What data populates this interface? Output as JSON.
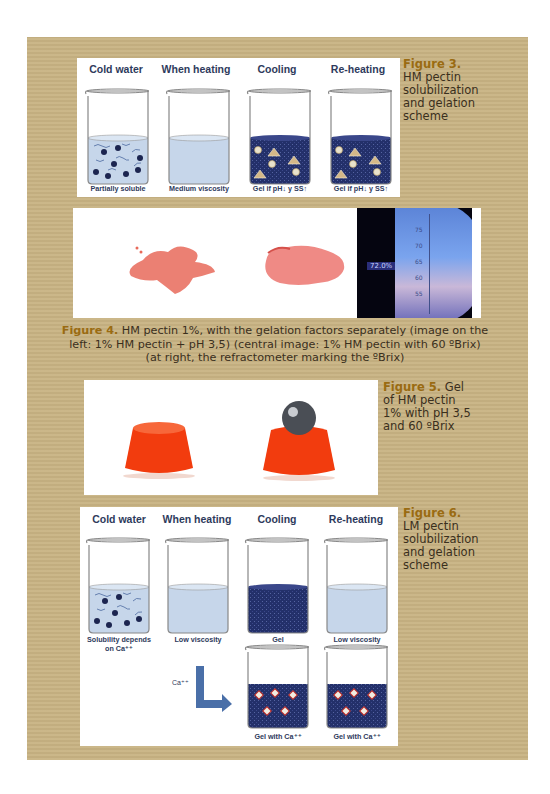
{
  "figure3": {
    "number": "Figure 3.",
    "caption": [
      "HM pectin",
      "solubilization",
      "and gelation",
      "scheme"
    ],
    "columns": [
      "Cold water",
      "When heating",
      "Cooling",
      "Re-heating"
    ],
    "beaker_labels": [
      "Partially soluble",
      "Medium viscosity",
      "Gel if  pH↓ y SS↑",
      "Gel if  pH↓ y SS↑"
    ]
  },
  "figure4": {
    "number": "Figure 4.",
    "caption_line1": " HM pectin 1%, with the gelation factors separately (image on the",
    "caption_line2": "left: 1% HM pectin + pH 3,5) (central image: 1% HM pectin with 60 ºBrix)",
    "caption_line3": "(at right, the refractometer marking the ºBrix)",
    "refractometer": {
      "scale": [
        "75",
        "70",
        "65",
        "60",
        "55"
      ],
      "indicator": "72.0%"
    }
  },
  "figure5": {
    "number": "Figure 5.",
    "caption": [
      " Gel",
      "of HM pectin",
      "1% with pH 3,5",
      "and 60 ºBrix"
    ]
  },
  "figure6": {
    "number": "Figure 6.",
    "caption": [
      "LM pectin",
      "solubilization",
      "and gelation",
      "scheme"
    ],
    "columns": [
      "Cold water",
      "When heating",
      "Cooling",
      "Re-heating"
    ],
    "beaker_labels": [
      "Solubility depends",
      "on Ca⁺⁺",
      "Low viscosity",
      "Gel",
      "Low viscosity"
    ],
    "ca_label": "Ca⁺⁺",
    "lower_labels": [
      "Gel with Ca⁺⁺",
      "Gel with Ca⁺⁺"
    ]
  },
  "colors": {
    "panel": "#c8b383",
    "figure_label": "#9a6b12",
    "gel": "#23306a",
    "liquid": "#c6d6ea",
    "arrow": "#4a6fa8"
  }
}
